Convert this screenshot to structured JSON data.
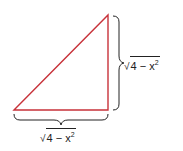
{
  "diagram": {
    "type": "right-triangle",
    "triangle_color": "#c8323a",
    "brace_color": "#222222",
    "labels": {
      "vertical_side": {
        "radical": "√",
        "radicand": "4 − x",
        "exponent": "2"
      },
      "horizontal_side": {
        "radical": "√",
        "radicand": "4 − x",
        "exponent": "2"
      }
    }
  }
}
